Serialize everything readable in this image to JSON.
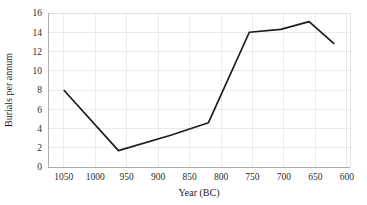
{
  "chart_data": {
    "type": "line",
    "title": "",
    "xlabel": "Year (BC)",
    "ylabel": "Burials per annum",
    "xlim": [
      1075,
      595
    ],
    "ylim": [
      0,
      16
    ],
    "x_reversed": true,
    "grid": true,
    "legend": "none",
    "xticks": [
      "1050",
      "1000",
      "950",
      "900",
      "850",
      "800",
      "750",
      "700",
      "650",
      "600"
    ],
    "xtick_values": [
      1050,
      1000,
      950,
      900,
      850,
      800,
      750,
      700,
      650,
      600
    ],
    "yticks": [
      "0",
      "2",
      "4",
      "6",
      "8",
      "10",
      "12",
      "14",
      "16"
    ],
    "ytick_values": [
      0,
      2,
      4,
      6,
      8,
      10,
      12,
      14,
      16
    ],
    "series": [
      {
        "name": "Burials per annum",
        "color": "#1c1c1c",
        "x": [
          1050,
          963,
          880,
          820,
          755,
          705,
          660,
          620
        ],
        "values": [
          8.0,
          1.7,
          3.3,
          4.6,
          14.0,
          14.3,
          15.1,
          12.8
        ]
      }
    ]
  },
  "axes": {
    "x_axis_title": "Year (BC)",
    "y_axis_title": "Burials per annum"
  }
}
